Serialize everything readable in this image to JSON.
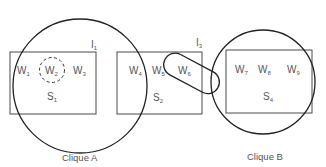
{
  "diagram": {
    "sentences": [
      {
        "id": "S1",
        "label": "S",
        "sub": "1",
        "words": [
          {
            "label": "W",
            "sub": "1"
          },
          {
            "label": "W",
            "sub": "2"
          },
          {
            "label": "W",
            "sub": "3"
          }
        ]
      },
      {
        "id": "S2",
        "label": "S",
        "sub": "2",
        "words": [
          {
            "label": "W",
            "sub": "4"
          },
          {
            "label": "W",
            "sub": "5"
          },
          {
            "label": "W",
            "sub": "6"
          }
        ]
      },
      {
        "id": "S4",
        "label": "S",
        "sub": "4",
        "words": [
          {
            "label": "W",
            "sub": "7"
          },
          {
            "label": "W",
            "sub": "8"
          },
          {
            "label": "W",
            "sub": "9"
          }
        ]
      }
    ],
    "interfaces": [
      {
        "label": "I",
        "sub": "1"
      },
      {
        "label": "I",
        "sub": "3"
      }
    ],
    "cliques": [
      {
        "label": "Clique A"
      },
      {
        "label": "Clique B"
      }
    ]
  }
}
